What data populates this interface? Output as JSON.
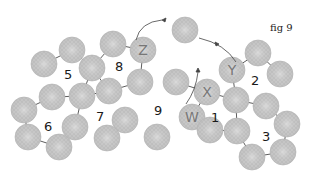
{
  "figure": {
    "title": "fig 9",
    "bead_color": "#c4c4c4",
    "bead_stroke": "#b0b0b0",
    "thread_color": "#333333",
    "bead_radius": 13,
    "beads": [
      {
        "x": 185,
        "y": 30,
        "letter": ""
      },
      {
        "x": 72,
        "y": 50,
        "letter": ""
      },
      {
        "x": 113,
        "y": 44,
        "letter": ""
      },
      {
        "x": 44,
        "y": 64,
        "letter": ""
      },
      {
        "x": 92,
        "y": 68,
        "letter": ""
      },
      {
        "x": 143,
        "y": 50,
        "letter": "Z"
      },
      {
        "x": 232,
        "y": 70,
        "letter": "Y"
      },
      {
        "x": 258,
        "y": 53,
        "letter": ""
      },
      {
        "x": 280,
        "y": 74,
        "letter": ""
      },
      {
        "x": 140,
        "y": 82,
        "letter": ""
      },
      {
        "x": 176,
        "y": 82,
        "letter": ""
      },
      {
        "x": 207,
        "y": 92,
        "letter": "X"
      },
      {
        "x": 82,
        "y": 96,
        "letter": ""
      },
      {
        "x": 109,
        "y": 91,
        "letter": ""
      },
      {
        "x": 24,
        "y": 110,
        "letter": ""
      },
      {
        "x": 52,
        "y": 97,
        "letter": ""
      },
      {
        "x": 236,
        "y": 100,
        "letter": ""
      },
      {
        "x": 266,
        "y": 106,
        "letter": ""
      },
      {
        "x": 287,
        "y": 124,
        "letter": ""
      },
      {
        "x": 125,
        "y": 120,
        "letter": ""
      },
      {
        "x": 192,
        "y": 117,
        "letter": "W"
      },
      {
        "x": 75,
        "y": 127,
        "letter": ""
      },
      {
        "x": 237,
        "y": 131,
        "letter": ""
      },
      {
        "x": 28,
        "y": 137,
        "letter": ""
      },
      {
        "x": 59,
        "y": 147,
        "letter": ""
      },
      {
        "x": 107,
        "y": 138,
        "letter": ""
      },
      {
        "x": 157,
        "y": 137,
        "letter": ""
      },
      {
        "x": 210,
        "y": 130,
        "letter": ""
      },
      {
        "x": 252,
        "y": 157,
        "letter": ""
      },
      {
        "x": 283,
        "y": 152,
        "letter": ""
      }
    ],
    "region_labels": [
      {
        "text": "5",
        "x": 64,
        "y": 68
      },
      {
        "text": "8",
        "x": 115,
        "y": 60
      },
      {
        "text": "6",
        "x": 44,
        "y": 120
      },
      {
        "text": "7",
        "x": 96,
        "y": 110
      },
      {
        "text": "9",
        "x": 154,
        "y": 104
      },
      {
        "text": "1",
        "x": 211,
        "y": 111
      },
      {
        "text": "2",
        "x": 251,
        "y": 74
      },
      {
        "text": "3",
        "x": 262,
        "y": 130
      }
    ]
  }
}
